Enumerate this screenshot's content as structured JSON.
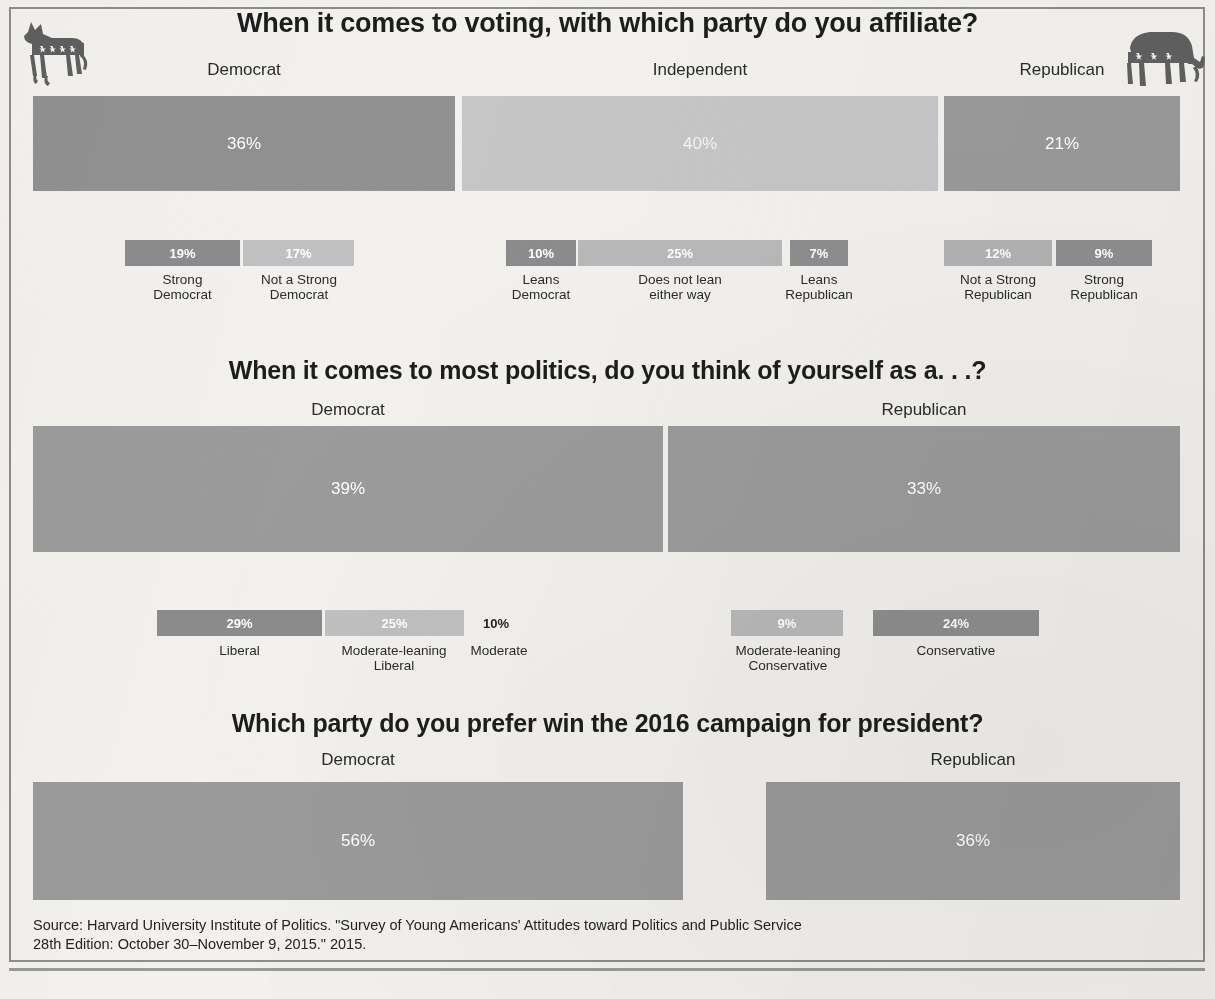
{
  "logos": {
    "left": "democratic-donkey-icon",
    "right": "republican-elephant-icon"
  },
  "sections": [
    {
      "id": "party-affiliation",
      "title": "When it comes to voting, with which party do you affiliate?",
      "categories": [
        {
          "label": "Democrat",
          "value": "36%"
        },
        {
          "label": "Independent",
          "value": "40%"
        },
        {
          "label": "Republican",
          "value": "21%"
        }
      ],
      "subcategories": [
        {
          "label": "Strong\nDemocrat",
          "value": "19%"
        },
        {
          "label": "Not a Strong\nDemocrat",
          "value": "17%"
        },
        {
          "label": "Leans\nDemocrat",
          "value": "10%"
        },
        {
          "label": "Does not lean\neither way",
          "value": "25%"
        },
        {
          "label": "Leans\nRepublican",
          "value": "7%"
        },
        {
          "label": "Not a Strong\nRepublican",
          "value": "12%"
        },
        {
          "label": "Strong\nRepublican",
          "value": "9%"
        }
      ]
    },
    {
      "id": "political-identity",
      "title": "When it comes to most politics, do you think of yourself as a. . .?",
      "categories": [
        {
          "label": "Democrat",
          "value": "39%"
        },
        {
          "label": "Republican",
          "value": "33%"
        }
      ],
      "subcategories": [
        {
          "label": "Liberal",
          "value": "29%"
        },
        {
          "label": "Moderate-leaning\nLiberal",
          "value": "25%"
        },
        {
          "label": "Moderate",
          "value": "10%"
        },
        {
          "label": "Moderate-leaning\nConservative",
          "value": "9%"
        },
        {
          "label": "Conservative",
          "value": "24%"
        }
      ]
    },
    {
      "id": "2016-preference",
      "title": "Which party do you prefer win the 2016 campaign for president?",
      "categories": [
        {
          "label": "Democrat",
          "value": "56%"
        },
        {
          "label": "Republican",
          "value": "36%"
        }
      ],
      "subcategories": []
    }
  ],
  "source": {
    "line1": "Source: Harvard University Institute of Politics. \"Survey of Young Americans' Attitudes toward Politics and Public Service",
    "line2": "28th Edition: October 30–November 9, 2015.\" 2015."
  },
  "colors": {
    "background": "#f2f1ee",
    "dark_gray": "#8b8b8b",
    "mid_gray": "#9a9a9a",
    "light_gray": "#bcbcbc",
    "lighter_gray": "#cfcfcf",
    "frame": "#8d8d8a",
    "title_text": "#1d1d1d"
  },
  "chart_data": [
    {
      "type": "bar",
      "orientation": "horizontal-stacked",
      "title": "When it comes to voting, with which party do you affiliate?",
      "categories": [
        "Democrat",
        "Independent",
        "Republican"
      ],
      "values": [
        36,
        40,
        21
      ],
      "unit": "percent",
      "breakdown": {
        "categories": [
          "Strong Democrat",
          "Not a Strong Democrat",
          "Leans Democrat",
          "Does not lean either way",
          "Leans Republican",
          "Not a Strong Republican",
          "Strong Republican"
        ],
        "values": [
          19,
          17,
          10,
          25,
          7,
          12,
          9
        ]
      },
      "xlabel": "",
      "ylabel": "",
      "grid": false,
      "legend": "none"
    },
    {
      "type": "bar",
      "orientation": "horizontal-stacked",
      "title": "When it comes to most politics, do you think of yourself as a. . .?",
      "categories": [
        "Democrat",
        "Republican"
      ],
      "values": [
        39,
        33
      ],
      "unit": "percent",
      "breakdown": {
        "categories": [
          "Liberal",
          "Moderate-leaning Liberal",
          "Moderate",
          "Moderate-leaning Conservative",
          "Conservative"
        ],
        "values": [
          29,
          25,
          10,
          9,
          24
        ]
      },
      "xlabel": "",
      "ylabel": "",
      "grid": false,
      "legend": "none"
    },
    {
      "type": "bar",
      "orientation": "horizontal-stacked",
      "title": "Which party do you prefer win the 2016 campaign for president?",
      "categories": [
        "Democrat",
        "Republican"
      ],
      "values": [
        56,
        36
      ],
      "unit": "percent",
      "xlabel": "",
      "ylabel": "",
      "grid": false,
      "legend": "none"
    }
  ]
}
